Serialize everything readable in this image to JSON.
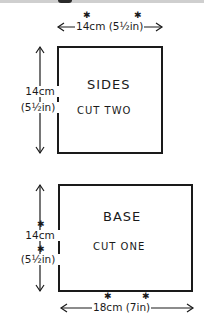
{
  "colors": {
    "ink": "#1a1a1a",
    "paper": "#ffffff",
    "top_strip": "#cfcfcf"
  },
  "pieces": [
    {
      "name": "SIDES",
      "instruction": "CUT TWO",
      "width_label": "14cm (5½in)",
      "width_cm": "14cm",
      "width_in": "(5½in)",
      "height_cm": "14cm",
      "height_in": "(5½in)",
      "marked": true
    },
    {
      "name": "BASE",
      "instruction": "CUT ONE",
      "width_label": "18cm (7in)",
      "width_cm": "18cm",
      "width_in": "(7in)",
      "height_cm": "14cm",
      "height_in": "(5½in)",
      "marked": true
    }
  ],
  "marker_symbol": "✱",
  "icons": {
    "arrow_left": "←",
    "arrow_right": "→",
    "arrow_up": "↑",
    "arrow_down": "↓"
  }
}
